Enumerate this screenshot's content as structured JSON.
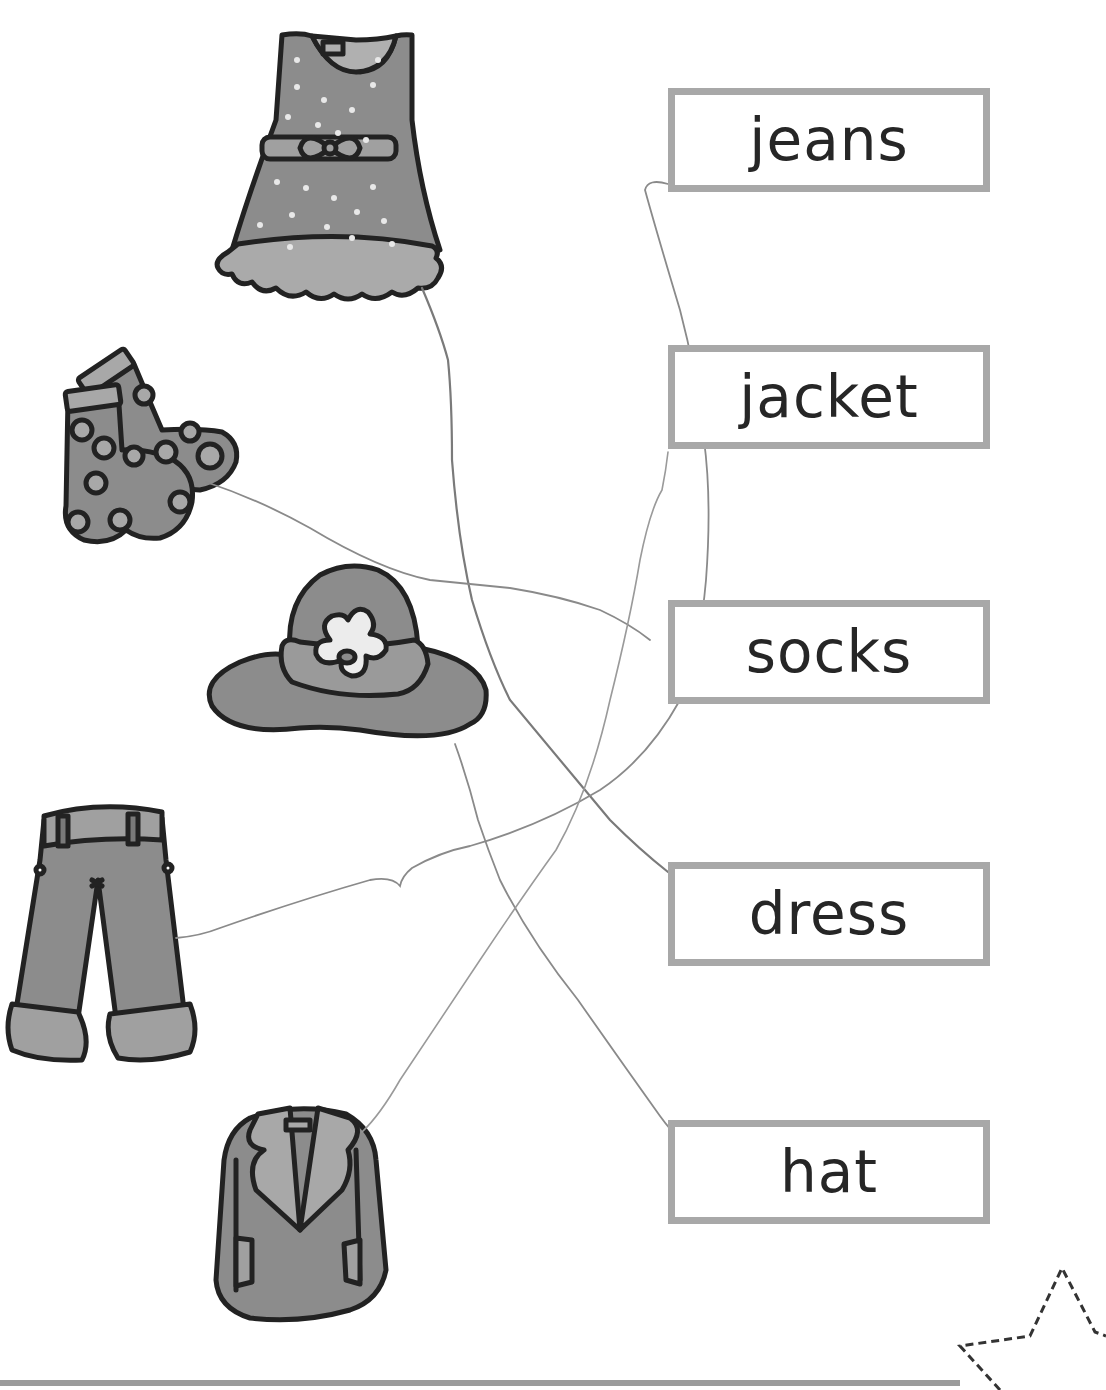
{
  "worksheet": {
    "title": "Clothes matching worksheet",
    "pictures": [
      {
        "id": "dress",
        "icon": "dress-icon"
      },
      {
        "id": "socks",
        "icon": "socks-icon"
      },
      {
        "id": "hat",
        "icon": "hat-icon"
      },
      {
        "id": "jeans",
        "icon": "jeans-icon"
      },
      {
        "id": "jacket",
        "icon": "jacket-icon"
      }
    ],
    "words": [
      {
        "label": "jeans"
      },
      {
        "label": "jacket"
      },
      {
        "label": "socks"
      },
      {
        "label": "dress"
      },
      {
        "label": "hat"
      }
    ],
    "drawn_connections": [
      {
        "from": "dress",
        "to": "dress"
      },
      {
        "from": "socks",
        "to": "socks"
      },
      {
        "from": "hat",
        "to": "hat"
      },
      {
        "from": "jeans",
        "to": "jeans"
      },
      {
        "from": "jacket",
        "to": "jacket"
      }
    ],
    "decorations": {
      "corner_star": "dashed-star-icon"
    },
    "colors": {
      "box_border": "#a8a8a8",
      "text": "#262626",
      "clothing_fill": "#8c8c8c",
      "outline": "#222222",
      "pencil": "#7a7a7a"
    }
  }
}
